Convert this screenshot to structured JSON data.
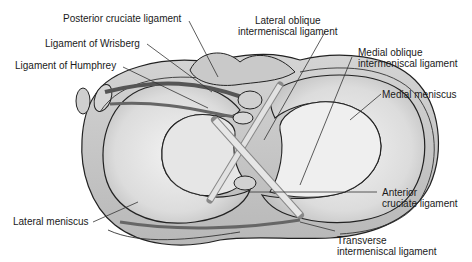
{
  "figure": {
    "colors": {
      "background": "#ffffff",
      "meniscus_fill": "#d9d9d9",
      "meniscus_light": "#ececec",
      "tissue_fill": "#c8c8c8",
      "outline": "#222222",
      "leader_line": "#333333"
    }
  },
  "labels": {
    "posterior_cruciate": "Posterior cruciate ligament",
    "wrisberg": "Ligament of Wrisberg",
    "humphrey": "Ligament of Humphrey",
    "lateral_oblique": "Lateral oblique\nintermeniscal ligament",
    "medial_oblique": "Medial oblique\nintermeniscal ligament",
    "medial_meniscus": "Medial meniscus",
    "anterior_cruciate": "Anterior\ncruciate ligament",
    "transverse": "Transverse\nintermeniscal ligament",
    "lateral_meniscus": "Lateral meniscus"
  }
}
